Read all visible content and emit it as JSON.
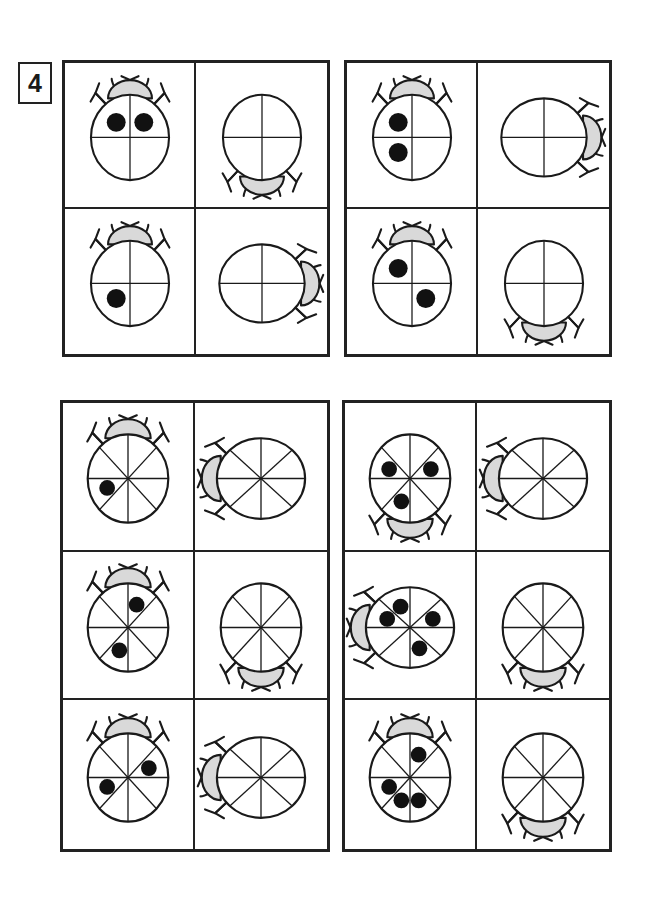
{
  "worksheet": {
    "exercise_number": "4",
    "colors": {
      "ink": "#1a1a1a",
      "border": "#222222",
      "head_fill": "#d9d9d9",
      "spot_fill": "#111111",
      "body_fill": "#ffffff",
      "page_background": "#ffffff"
    }
  },
  "blocks": [
    {
      "id": "block-1",
      "name": "quarters-block-top-left",
      "rows": 2,
      "columns": 2,
      "cells": [
        {
          "name": "ladybug-1-1",
          "segments": 4,
          "rotation": 0,
          "spots": 2,
          "spot_segments": [
            1,
            4
          ],
          "head": "top"
        },
        {
          "name": "ladybug-1-2",
          "segments": 4,
          "rotation": 180,
          "spots": 0,
          "spot_segments": [],
          "head": "bottom"
        },
        {
          "name": "ladybug-1-3",
          "segments": 4,
          "rotation": 0,
          "spots": 1,
          "spot_segments": [
            3
          ],
          "head": "top"
        },
        {
          "name": "ladybug-1-4",
          "segments": 4,
          "rotation": 90,
          "spots": 0,
          "spot_segments": [],
          "head": "right"
        }
      ]
    },
    {
      "id": "block-2",
      "name": "quarters-block-top-right",
      "rows": 2,
      "columns": 2,
      "cells": [
        {
          "name": "ladybug-2-1",
          "segments": 4,
          "rotation": 0,
          "spots": 2,
          "spot_segments": [
            3,
            4
          ],
          "head": "top"
        },
        {
          "name": "ladybug-2-2",
          "segments": 4,
          "rotation": 90,
          "spots": 0,
          "spot_segments": [],
          "head": "right"
        },
        {
          "name": "ladybug-2-3",
          "segments": 4,
          "rotation": 0,
          "spots": 2,
          "spot_segments": [
            2,
            4
          ],
          "head": "top"
        },
        {
          "name": "ladybug-2-4",
          "segments": 4,
          "rotation": 180,
          "spots": 0,
          "spot_segments": [],
          "head": "bottom"
        }
      ]
    },
    {
      "id": "block-3",
      "name": "eighths-block-bottom-left",
      "rows": 3,
      "columns": 2,
      "cells": [
        {
          "name": "ladybug-3-1",
          "segments": 8,
          "rotation": 0,
          "spots": 1,
          "spot_segments": [
            6
          ],
          "head": "top"
        },
        {
          "name": "ladybug-3-2",
          "segments": 8,
          "rotation": 270,
          "spots": 0,
          "spot_segments": [],
          "head": "left"
        },
        {
          "name": "ladybug-3-3",
          "segments": 8,
          "rotation": 0,
          "spots": 2,
          "spot_segments": [
            1,
            5
          ],
          "head": "top"
        },
        {
          "name": "ladybug-3-4",
          "segments": 8,
          "rotation": 180,
          "spots": 0,
          "spot_segments": [],
          "head": "bottom"
        },
        {
          "name": "ladybug-3-5",
          "segments": 8,
          "rotation": 0,
          "spots": 2,
          "spot_segments": [
            2,
            6
          ],
          "head": "top"
        },
        {
          "name": "ladybug-3-6",
          "segments": 8,
          "rotation": 270,
          "spots": 0,
          "spot_segments": [],
          "head": "left"
        }
      ]
    },
    {
      "id": "block-4",
      "name": "eighths-block-bottom-right",
      "rows": 3,
      "columns": 2,
      "cells": [
        {
          "name": "ladybug-4-1",
          "segments": 8,
          "rotation": 180,
          "spots": 3,
          "spot_segments": [
            1,
            3,
            6
          ],
          "head": "bottom"
        },
        {
          "name": "ladybug-4-2",
          "segments": 8,
          "rotation": 270,
          "spots": 0,
          "spot_segments": [],
          "head": "left"
        },
        {
          "name": "ladybug-4-3",
          "segments": 8,
          "rotation": 270,
          "spots": 4,
          "spot_segments": [
            1,
            2,
            4,
            6
          ],
          "head": "left"
        },
        {
          "name": "ladybug-4-4",
          "segments": 8,
          "rotation": 180,
          "spots": 0,
          "spot_segments": [],
          "head": "bottom"
        },
        {
          "name": "ladybug-4-5",
          "segments": 8,
          "rotation": 0,
          "spots": 4,
          "spot_segments": [
            1,
            4,
            5,
            6
          ],
          "head": "top"
        },
        {
          "name": "ladybug-4-6",
          "segments": 8,
          "rotation": 180,
          "spots": 0,
          "spot_segments": [],
          "head": "bottom"
        }
      ]
    }
  ]
}
